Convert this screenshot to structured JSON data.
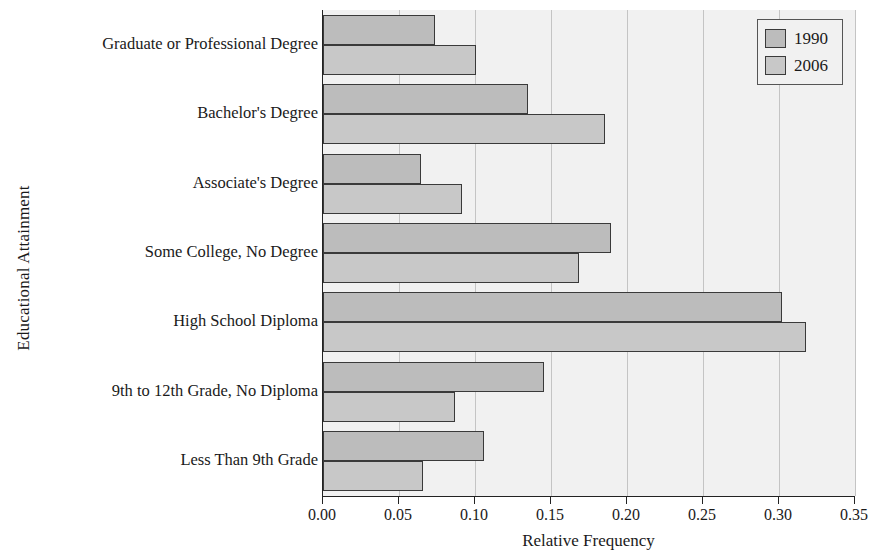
{
  "chart_data": {
    "type": "bar",
    "orientation": "horizontal",
    "title": "",
    "xlabel": "Relative Frequency",
    "ylabel": "Educational Attainment",
    "xlim": [
      0.0,
      0.35
    ],
    "xticks": [
      "0.00",
      "0.05",
      "0.10",
      "0.15",
      "0.20",
      "0.25",
      "0.30",
      "0.35"
    ],
    "xtick_values": [
      0.0,
      0.05,
      0.1,
      0.15,
      0.2,
      0.25,
      0.3,
      0.35
    ],
    "grid": "vertical",
    "legend_position": "top-right",
    "categories": [
      "Graduate or Professional Degree",
      "Bachelor's Degree",
      "Associate's Degree",
      "Some College, No Degree",
      "High School Diploma",
      "9th to 12th Grade, No Diploma",
      "Less Than 9th Grade"
    ],
    "series": [
      {
        "name": "1990",
        "color": "#bcbcbc",
        "values": [
          0.073,
          0.134,
          0.064,
          0.189,
          0.301,
          0.145,
          0.105
        ]
      },
      {
        "name": "2006",
        "color": "#c8c8c8",
        "values": [
          0.1,
          0.185,
          0.091,
          0.168,
          0.317,
          0.086,
          0.065
        ]
      }
    ]
  },
  "legend": {
    "items": [
      {
        "label": "1990"
      },
      {
        "label": "2006"
      }
    ]
  },
  "axes": {
    "x_title": "Relative Frequency",
    "y_title": "Educational Attainment"
  }
}
